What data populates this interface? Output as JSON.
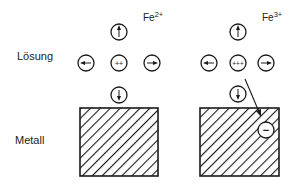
{
  "labels": {
    "solution": "Lösung",
    "metal": "Metall"
  },
  "left": {
    "ion_base": "Fe",
    "ion_charge": "2+",
    "center_charge": "++"
  },
  "right": {
    "ion_base": "Fe",
    "ion_charge": "3+",
    "center_charge": "+++",
    "electron_symbol": "−"
  },
  "colors": {
    "ink": "#1a1a1a",
    "background": "#ffffff"
  }
}
